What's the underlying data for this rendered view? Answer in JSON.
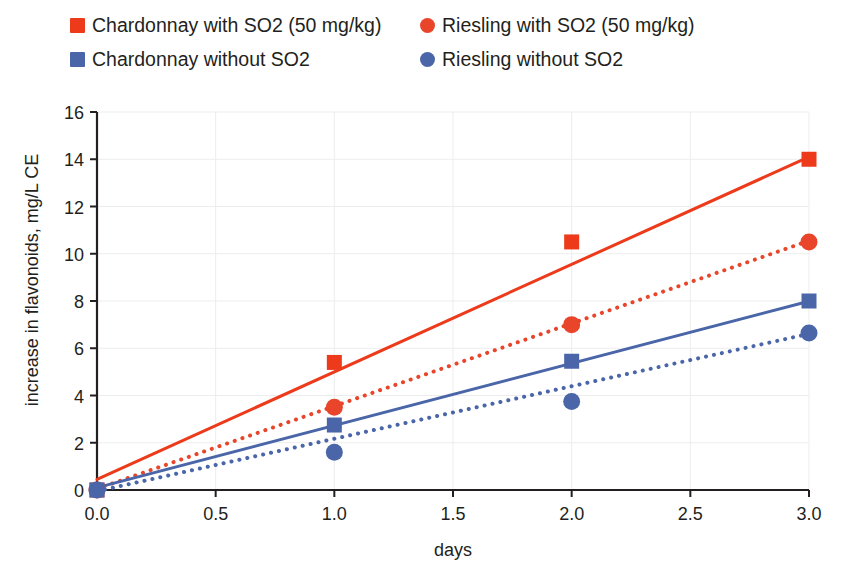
{
  "chart_data": {
    "type": "scatter",
    "title": "",
    "xlabel": "days",
    "ylabel": "increase in flavonoids, mg/L CE",
    "xlim": [
      0,
      3
    ],
    "ylim": [
      0,
      16
    ],
    "xticks": [
      "0.0",
      "0.5",
      "1.0",
      "1.5",
      "2.0",
      "2.5",
      "3.0"
    ],
    "yticks": [
      "0",
      "2",
      "4",
      "6",
      "8",
      "10",
      "12",
      "14",
      "16"
    ],
    "grid": true,
    "legend_position": "top",
    "x": [
      0,
      1,
      2,
      3
    ],
    "series": [
      {
        "name": "Chardonnay with SO2 (50 mg/kg)",
        "marker": "square",
        "color": "#ED3A1B",
        "line_style": "solid",
        "values": [
          0,
          5.4,
          10.5,
          14.0
        ],
        "trendline": {
          "intercept": 0.45,
          "slope": 4.55
        }
      },
      {
        "name": "Riesling with SO2 (50 mg/kg)",
        "marker": "circle",
        "color": "#E8452A",
        "line_style": "dotted",
        "values": [
          0,
          3.5,
          7.0,
          10.5
        ],
        "trendline": {
          "intercept": 0.05,
          "slope": 3.5
        }
      },
      {
        "name": "Chardonnay without SO2",
        "marker": "square",
        "color": "#4A66A8",
        "line_style": "solid",
        "values": [
          0,
          2.75,
          5.45,
          8.0
        ],
        "trendline": {
          "intercept": 0.1,
          "slope": 2.63
        }
      },
      {
        "name": "Riesling without SO2",
        "marker": "circle",
        "color": "#4A66A8",
        "line_style": "dotted",
        "values": [
          0,
          1.6,
          3.75,
          6.65
        ],
        "trendline": {
          "intercept": -0.05,
          "slope": 2.22
        }
      }
    ]
  },
  "legend": {
    "rows": [
      [
        {
          "label": "Chardonnay with SO2 (50 mg/kg)",
          "marker": "square",
          "color": "#ED3A1B"
        },
        {
          "label": "Riesling with SO2 (50 mg/kg)",
          "marker": "circle",
          "color": "#E8452A"
        }
      ],
      [
        {
          "label": "Chardonnay without SO2",
          "marker": "square",
          "color": "#4A66A8"
        },
        {
          "label": "Riesling without SO2",
          "marker": "circle",
          "color": "#4A66A8"
        }
      ]
    ]
  },
  "axes": {
    "x_title": "days",
    "y_title": "increase in flavonoids, mg/L CE"
  },
  "colors": {
    "red_solid": "#ED3A1B",
    "red_dotted": "#E8452A",
    "blue": "#4A66A8",
    "axis": "#231f20",
    "grid": "#ededed",
    "background": "#ffffff"
  }
}
